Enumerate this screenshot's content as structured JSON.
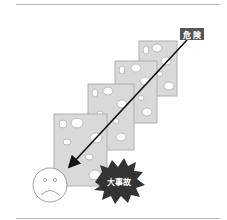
{
  "figure": {
    "labels": {
      "hazard": "危 険",
      "accident": "大事故"
    },
    "slices": [
      {
        "id": "slice-1",
        "x": 54,
        "y": 114,
        "w": 53,
        "h": 72
      },
      {
        "id": "slice-2",
        "x": 88,
        "y": 84,
        "w": 46,
        "h": 66
      },
      {
        "id": "slice-3",
        "x": 115,
        "y": 61,
        "w": 42,
        "h": 62
      },
      {
        "id": "slice-4",
        "x": 139,
        "y": 41,
        "w": 38,
        "h": 55
      }
    ],
    "colors": {
      "slice_fill": "#d9d9d9",
      "slice_edge": "#b0b0b0",
      "hole": "#ffffff",
      "label_bg": "#555555",
      "burst": "#333333",
      "arrow": "#111111",
      "rule": "#b8b8b8"
    },
    "icons": {
      "face": "sad-face-icon",
      "arrow": "hazard-trajectory-arrow"
    }
  }
}
